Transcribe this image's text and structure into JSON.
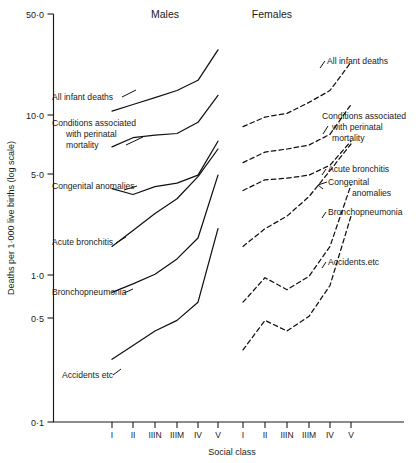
{
  "chart_data": {
    "type": "line",
    "title": "",
    "xlabel": "Social class",
    "ylabel": "Deaths per 1·000 live births (log scale)",
    "yscale": "log",
    "ylim": [
      0.1,
      50.0
    ],
    "ytick_labels": [
      "50·0",
      "10·0",
      "5·0",
      "1·0",
      "0·5",
      "0·1"
    ],
    "ytick_values": [
      50.0,
      10.0,
      5.0,
      1.0,
      0.5,
      0.1
    ],
    "grid": false,
    "legend": "inline-labels",
    "categories": [
      "I",
      "II",
      "IIIN",
      "IIIM",
      "IV",
      "V"
    ],
    "panels": [
      {
        "name": "Males",
        "linestyle": "solid",
        "series": [
          {
            "name": "All infant deaths",
            "values": [
              11.4,
              12.6,
              14.0,
              15.6,
              18.2,
              29.0
            ]
          },
          {
            "name": "Conditions associated with perinatal mortality",
            "values": [
              6.6,
              7.6,
              7.9,
              8.1,
              9.6,
              14.5
            ]
          },
          {
            "name": "Congenital anomalies",
            "values": [
              3.5,
              3.2,
              3.6,
              3.8,
              4.3,
              7.2
            ]
          },
          {
            "name": "Acute bronchitis",
            "values": [
              1.45,
              1.85,
              2.4,
              3.0,
              4.2,
              6.4
            ]
          },
          {
            "name": "Bronchopneumonia",
            "values": [
              0.72,
              0.82,
              0.95,
              1.2,
              1.65,
              4.3
            ]
          },
          {
            "name": "Accidents etc",
            "values": [
              0.26,
              0.32,
              0.4,
              0.47,
              0.62,
              1.9
            ]
          }
        ]
      },
      {
        "name": "Females",
        "linestyle": "dashed",
        "series": [
          {
            "name": "All infant deaths",
            "values": [
              9.0,
              10.4,
              11.0,
              13.0,
              15.6,
              24.0
            ]
          },
          {
            "name": "Conditions associated with perinatal mortality",
            "values": [
              5.2,
              6.1,
              6.4,
              6.8,
              8.0,
              12.6
            ]
          },
          {
            "name": "Acute bronchitis",
            "values": [
              3.4,
              4.0,
              4.1,
              4.3,
              5.0,
              7.2
            ]
          },
          {
            "name": "Congenital anomalies",
            "values": [
              1.45,
              1.9,
              2.3,
              3.1,
              4.6,
              6.9
            ]
          },
          {
            "name": "Bronchopneumonia",
            "values": [
              0.62,
              0.9,
              0.75,
              0.92,
              1.45,
              3.7
            ]
          },
          {
            "name": "Accidents etc",
            "values": [
              0.3,
              0.47,
              0.4,
              0.5,
              0.8,
              2.3
            ]
          }
        ]
      }
    ],
    "annotations": {
      "males_labels": [
        "All infant deaths",
        "Conditions associated with perinatal mortality",
        "Congenital anomalies",
        "Acute bronchitis",
        "Bronchopneumonia",
        "Accidents etc"
      ],
      "females_labels": [
        "All infant deaths",
        "Conditions associated with perinatal mortality",
        "Acute bronchitis",
        "Congenital anomalies",
        "Bronchopneumonia",
        "Accidents etc"
      ]
    }
  },
  "labels": {
    "panel_males": "Males",
    "panel_females": "Females",
    "y_axis_title": "Deaths per 1·000 live births (log scale)",
    "x_axis_title": "Social class",
    "ytick_0": "50·0",
    "ytick_1": "10·0",
    "ytick_2": "5·0",
    "ytick_3": "1·0",
    "ytick_4": "0·5",
    "ytick_5": "0·1",
    "xtick_0": "I",
    "xtick_1": "II",
    "xtick_2": "IIIN",
    "xtick_3": "IIIM",
    "xtick_4": "IV",
    "xtick_5": "V",
    "m_lab_0": "All infant deaths",
    "m_lab_1a": "Conditions associated",
    "m_lab_1b": "with perinatal",
    "m_lab_1c": "mortality",
    "m_lab_2": "Congenital anomalies",
    "m_lab_3": "Acute bronchitis",
    "m_lab_4": "Bronchopneumonia",
    "m_lab_5": "Accidents etc",
    "f_lab_0": "All infant deaths",
    "f_lab_1a": "Conditions associated",
    "f_lab_1b": "with perinatal",
    "f_lab_1c": "mortality",
    "f_lab_2": "Acute bronchitis",
    "f_lab_3a": "Congenital",
    "f_lab_3b": "anomalies",
    "f_lab_4": "Bronchopneumonia",
    "f_lab_5": "Accidents.etc"
  },
  "colors": {
    "ink": "#111111",
    "background": "#ffffff"
  }
}
